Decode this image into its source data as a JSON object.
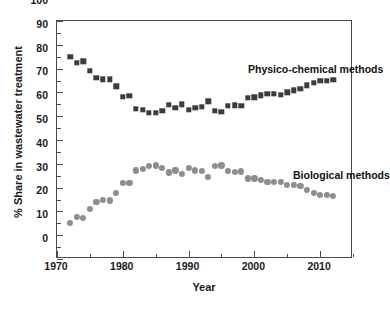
{
  "chart_data": {
    "type": "scatter",
    "title": "",
    "xlabel": "Year",
    "ylabel": "% Share in wastewater treatment",
    "xlim": [
      1970,
      2015
    ],
    "ylim": [
      0,
      100
    ],
    "xticks": [
      1970,
      1980,
      1990,
      2000,
      2010
    ],
    "xtick_labels": [
      "1970",
      "1980",
      "1990",
      "2000",
      "2010"
    ],
    "xminor_step": 5,
    "yticks": [
      0,
      10,
      20,
      30,
      40,
      50,
      60,
      70,
      80,
      90,
      100
    ],
    "ytick_labels": [
      "0",
      "10",
      "20",
      "30",
      "40",
      "50",
      "60",
      "70",
      "80",
      "90",
      "100"
    ],
    "yminor_step": 5,
    "grid": false,
    "legend_position": "in-plot annotations",
    "annotations": [
      {
        "text": "Physico-chemical methods",
        "x": 1988,
        "y": 81
      },
      {
        "text": "Biological methods",
        "x": 2000,
        "y": 37
      }
    ],
    "x": [
      1972,
      1973,
      1974,
      1975,
      1976,
      1977,
      1978,
      1979,
      1980,
      1981,
      1982,
      1983,
      1984,
      1985,
      1986,
      1987,
      1988,
      1989,
      1990,
      1991,
      1992,
      1993,
      1994,
      1995,
      1996,
      1997,
      1998,
      1999,
      2000,
      2001,
      2002,
      2003,
      2004,
      2005,
      2006,
      2007,
      2008,
      2009,
      2010,
      2011,
      2012
    ],
    "series": [
      {
        "name": "Physico-chemical methods",
        "marker": "square",
        "color": "#3c3c3c",
        "values": [
          85.0,
          82.5,
          83.0,
          79.0,
          76.2,
          75.5,
          75.5,
          72.5,
          68.2,
          68.5,
          63.2,
          62.8,
          61.5,
          61.3,
          62.3,
          64.8,
          63.5,
          65.0,
          62.6,
          63.6,
          64.0,
          66.2,
          62.2,
          61.8,
          64.3,
          64.5,
          64.3,
          67.8,
          68.0,
          68.8,
          69.4,
          69.5,
          68.9,
          70.0,
          70.8,
          71.5,
          73.0,
          74.0,
          75.0,
          75.0,
          75.2
        ]
      },
      {
        "name": "Biological methods",
        "marker": "circle",
        "color": "#8e8e8e",
        "values": [
          15.0,
          17.8,
          17.2,
          21.0,
          24.0,
          24.8,
          24.6,
          27.8,
          32.0,
          32.1,
          37.2,
          38.0,
          39.2,
          39.3,
          38.4,
          36.4,
          37.2,
          35.8,
          38.2,
          37.2,
          37.0,
          34.6,
          39.0,
          39.3,
          37.0,
          36.5,
          36.8,
          33.9,
          33.9,
          33.3,
          32.3,
          32.3,
          32.5,
          31.3,
          31.1,
          30.6,
          29.0,
          27.9,
          26.8,
          26.9,
          26.6
        ]
      }
    ]
  }
}
